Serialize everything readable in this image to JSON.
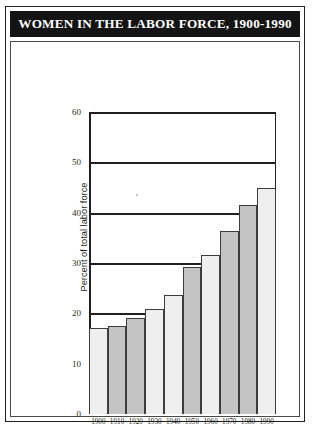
{
  "header": {
    "title": "WOMEN IN THE LABOR FORCE, 1900-1990"
  },
  "colors": {
    "banner_bg": "#141414",
    "banner_text": "#ffffff",
    "axis": "#231f20",
    "bar_light": "#efefef",
    "bar_dark": "#c4c4c4",
    "page_bg": "#ffffff"
  },
  "chart_data": {
    "type": "bar",
    "title": "WOMEN IN THE LABOR FORCE, 1900-1990",
    "xlabel": "",
    "ylabel": "Percent of total labor force",
    "categories": [
      "1900",
      "1910",
      "1920",
      "1930",
      "1940",
      "1950",
      "1960",
      "1970",
      "1980",
      "1990"
    ],
    "values": [
      17.0,
      17.5,
      19.0,
      20.8,
      23.6,
      29.2,
      31.6,
      36.3,
      41.5,
      45.0
    ],
    "ylim": [
      0,
      60
    ],
    "yticks": [
      0,
      10,
      20,
      30,
      40,
      50,
      60
    ],
    "gridlines": [
      20,
      30,
      40,
      50,
      60
    ],
    "grid": true,
    "legend": "none",
    "bar_fill_pattern": [
      "light",
      "dark",
      "dark",
      "light",
      "light",
      "dark",
      "light",
      "dark",
      "dark",
      "light"
    ]
  }
}
